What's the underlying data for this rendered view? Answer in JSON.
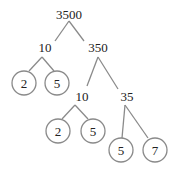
{
  "diagram": {
    "type": "factor-tree",
    "colors": {
      "line": "#8a8a8a",
      "text": "#222222",
      "circle": "#8a8a8a",
      "background": "#ffffff"
    },
    "nodes": [
      {
        "id": "n3500",
        "label": "3500",
        "x": 69,
        "y": 19,
        "prime": false
      },
      {
        "id": "n10a",
        "label": "10",
        "x": 45,
        "y": 52,
        "prime": false
      },
      {
        "id": "n350",
        "label": "350",
        "x": 98,
        "y": 52,
        "prime": false
      },
      {
        "id": "p2a",
        "label": "2",
        "x": 24,
        "y": 83,
        "prime": true
      },
      {
        "id": "p5a",
        "label": "5",
        "x": 57,
        "y": 83,
        "prime": true
      },
      {
        "id": "n10b",
        "label": "10",
        "x": 82,
        "y": 101,
        "prime": false
      },
      {
        "id": "n35",
        "label": "35",
        "x": 127,
        "y": 101,
        "prime": false
      },
      {
        "id": "p2b",
        "label": "2",
        "x": 58,
        "y": 131,
        "prime": true
      },
      {
        "id": "p5b",
        "label": "5",
        "x": 93,
        "y": 131,
        "prime": true
      },
      {
        "id": "p5c",
        "label": "5",
        "x": 121,
        "y": 150,
        "prime": true
      },
      {
        "id": "p7",
        "label": "7",
        "x": 155,
        "y": 150,
        "prime": true
      }
    ],
    "edges": [
      {
        "from": "n3500",
        "to": "n10a",
        "x1": 69,
        "y1": 21,
        "x2": 55,
        "y2": 41
      },
      {
        "from": "n3500",
        "to": "n350",
        "x1": 69,
        "y1": 21,
        "x2": 84,
        "y2": 41
      },
      {
        "from": "n10a",
        "to": "p2a",
        "x1": 42,
        "y1": 57,
        "x2": 29,
        "y2": 71
      },
      {
        "from": "n10a",
        "to": "p5a",
        "x1": 42,
        "y1": 57,
        "x2": 54,
        "y2": 71
      },
      {
        "from": "n350",
        "to": "n10b",
        "x1": 98,
        "y1": 57,
        "x2": 87,
        "y2": 86
      },
      {
        "from": "n350",
        "to": "n35",
        "x1": 98,
        "y1": 57,
        "x2": 118,
        "y2": 89
      },
      {
        "from": "n10b",
        "to": "p2b",
        "x1": 75,
        "y1": 105,
        "x2": 62,
        "y2": 119
      },
      {
        "from": "n10b",
        "to": "p5b",
        "x1": 75,
        "y1": 105,
        "x2": 88,
        "y2": 119
      },
      {
        "from": "n35",
        "to": "p5c",
        "x1": 125,
        "y1": 105,
        "x2": 122,
        "y2": 138
      },
      {
        "from": "n35",
        "to": "p7",
        "x1": 125,
        "y1": 105,
        "x2": 148,
        "y2": 138
      }
    ],
    "circle_radius": 12
  }
}
